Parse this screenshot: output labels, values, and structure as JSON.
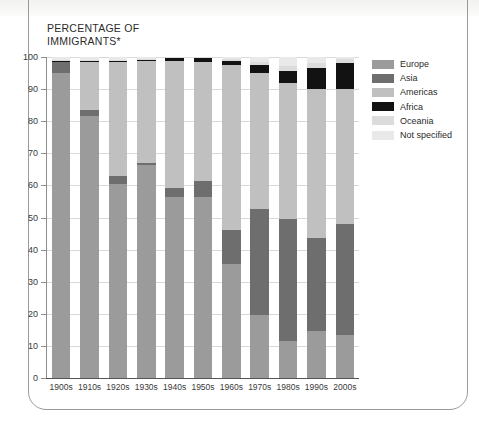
{
  "axis_title": "PERCENTAGE OF\nIMMIGRANTS*",
  "axis_title_line1": "PERCENTAGE OF",
  "axis_title_line2": "IMMIGRANTS*",
  "legend": {
    "items": [
      {
        "label": "Europe",
        "color": "#9b9b9b"
      },
      {
        "label": "Asia",
        "color": "#6e6e6e"
      },
      {
        "label": "Americas",
        "color": "#c0c0c0"
      },
      {
        "label": "Africa",
        "color": "#121212"
      },
      {
        "label": "Oceania",
        "color": "#dcdcdc"
      },
      {
        "label": "Not specified",
        "color": "#e9e9e9"
      }
    ]
  },
  "chart_data": {
    "type": "bar",
    "stacked": true,
    "title": "PERCENTAGE OF IMMIGRANTS*",
    "xlabel": "",
    "ylabel": "PERCENTAGE OF IMMIGRANTS*",
    "ylim": [
      0,
      100
    ],
    "yticks": [
      0,
      10,
      20,
      30,
      40,
      50,
      60,
      70,
      80,
      90,
      100
    ],
    "ytick_labels": [
      "0",
      "10",
      "20",
      "30",
      "40",
      "50",
      "60",
      "70",
      "80",
      "90",
      "100"
    ],
    "grid": true,
    "legend_position": "right",
    "categories": [
      "1900s",
      "1910s",
      "1920s",
      "1930s",
      "1940s",
      "1950s",
      "1960s",
      "1970s",
      "1980s",
      "1990s",
      "2000s"
    ],
    "series": [
      {
        "name": "Europe",
        "color": "#9b9b9b",
        "values": [
          95.0,
          81.5,
          60.5,
          66.5,
          56.5,
          56.5,
          35.5,
          19.5,
          11.5,
          14.5,
          13.5
        ]
      },
      {
        "name": "Asia",
        "color": "#6e6e6e",
        "values": [
          3.3,
          2.0,
          2.5,
          0.6,
          2.7,
          5.0,
          10.5,
          33.0,
          38.0,
          29.0,
          34.5
        ]
      },
      {
        "name": "Americas",
        "color": "#c0c0c0",
        "values": [
          0.4,
          15.0,
          35.5,
          32.0,
          39.5,
          37.0,
          51.5,
          42.5,
          42.5,
          46.5,
          42.0
        ]
      },
      {
        "name": "Africa",
        "color": "#121212",
        "values": [
          0.1,
          0.1,
          0.1,
          0.1,
          0.9,
          1.2,
          1.3,
          2.5,
          3.5,
          6.5,
          8.0
        ]
      },
      {
        "name": "Oceania",
        "color": "#dcdcdc",
        "values": [
          0.2,
          0.4,
          0.4,
          0.3,
          0.4,
          0.3,
          0.6,
          1.0,
          1.8,
          1.5,
          1.4
        ]
      },
      {
        "name": "Not specified",
        "color": "#e9e9e9",
        "values": [
          1.0,
          1.0,
          1.0,
          0.5,
          0.0,
          0.0,
          0.6,
          1.5,
          2.7,
          2.0,
          0.6
        ]
      }
    ]
  }
}
